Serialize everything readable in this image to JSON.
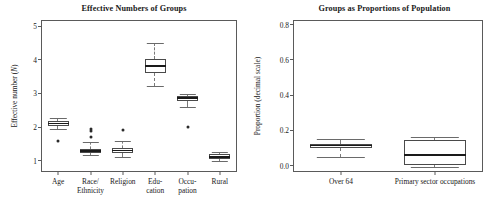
{
  "figure": {
    "panels": [
      "left",
      "right"
    ]
  },
  "chart_data": [
    {
      "type": "box",
      "panel": "left",
      "title": "Effective Numbers of Groups",
      "xlabel": "",
      "ylabel": "Effective number (N)",
      "ylabel_plain": "Effective number (",
      "ylabel_italic": "N",
      "ylabel_tail": ")",
      "ylim": [
        0.7,
        5.15
      ],
      "yticks": [
        1,
        2,
        3,
        4,
        5
      ],
      "ytick_labels": [
        "1",
        "2",
        "3",
        "4",
        "5"
      ],
      "grid": false,
      "legend": "none",
      "categories": [
        "Age",
        "Race/ Ethnicity",
        "Religion",
        "Edu- cation",
        "Occu- pation",
        "Rural"
      ],
      "category_labels": [
        {
          "line1": "Age",
          "line2": ""
        },
        {
          "line1": "Race/",
          "line2": "Ethnicity"
        },
        {
          "line1": "Religion",
          "line2": ""
        },
        {
          "line1": "Edu-",
          "line2": "cation"
        },
        {
          "line1": "Occu-",
          "line2": "pation"
        },
        {
          "line1": "Rural",
          "line2": ""
        }
      ],
      "boxes": [
        {
          "name": "Age",
          "whisker_low": 1.94,
          "q1": 2.03,
          "median": 2.11,
          "q3": 2.19,
          "whisker_high": 2.26,
          "outliers": [
            1.62
          ]
        },
        {
          "name": "Race/Ethnicity",
          "whisker_low": 1.17,
          "q1": 1.23,
          "median": 1.29,
          "q3": 1.34,
          "whisker_high": 1.55,
          "outliers": [
            1.93,
            1.98,
            1.76
          ]
        },
        {
          "name": "Religion",
          "whisker_low": 1.13,
          "q1": 1.24,
          "median": 1.31,
          "q3": 1.38,
          "whisker_high": 1.58,
          "outliers": [
            1.96
          ]
        },
        {
          "name": "Education",
          "whisker_low": 3.23,
          "q1": 3.62,
          "median": 3.82,
          "q3": 4.03,
          "whisker_high": 4.49,
          "outliers": []
        },
        {
          "name": "Occupation",
          "whisker_low": 2.6,
          "q1": 2.78,
          "median": 2.86,
          "q3": 2.93,
          "whisker_high": 2.99,
          "outliers": [
            2.05
          ]
        },
        {
          "name": "Rural",
          "whisker_low": 1.0,
          "q1": 1.05,
          "median": 1.11,
          "q3": 1.19,
          "whisker_high": 1.25,
          "outliers": []
        }
      ]
    },
    {
      "type": "box",
      "panel": "right",
      "title": "Groups as Proportions of Population",
      "xlabel": "",
      "ylabel": "Proportion (decimal scale)",
      "ylim": [
        -0.03,
        0.82
      ],
      "yticks": [
        0.0,
        0.2,
        0.4,
        0.6,
        0.8
      ],
      "ytick_labels": [
        "0.0",
        "0.2",
        "0.4",
        "0.6",
        "0.8"
      ],
      "grid": false,
      "legend": "none",
      "categories": [
        "Over 64",
        "Primary sector occupations"
      ],
      "category_labels": [
        {
          "line1": "Over 64",
          "line2": ""
        },
        {
          "line1": "Primary sector occupations",
          "line2": ""
        }
      ],
      "boxes": [
        {
          "name": "Over 64",
          "whisker_low": 0.05,
          "q1": 0.102,
          "median": 0.115,
          "q3": 0.124,
          "whisker_high": 0.152,
          "outliers": []
        },
        {
          "name": "Primary sector occupations",
          "whisker_low": -0.005,
          "q1": 0.002,
          "median": 0.06,
          "q3": 0.148,
          "whisker_high": 0.163,
          "outliers": []
        }
      ]
    }
  ]
}
